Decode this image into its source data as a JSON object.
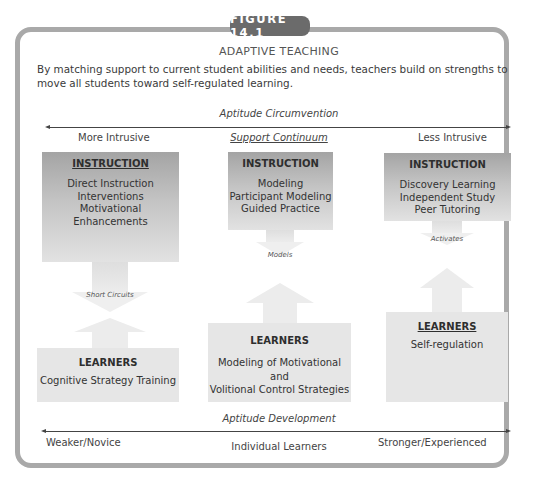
{
  "figure": {
    "badge": "FIGURE 14.1",
    "title": "ADAPTIVE TEACHING",
    "description": "By matching support to current student abilities and needs, teachers build on strengths to move all students toward self-regulated learning."
  },
  "top_axis": {
    "label": "Aptitude Circumvention",
    "left": "More Intrusive",
    "center": "Support Continuum",
    "right": "Less Intrusive"
  },
  "columns": [
    {
      "instruction": {
        "heading": "INSTRUCTION",
        "items": [
          "Direct Instruction",
          "Interventions",
          "Motivational Enhancements"
        ]
      },
      "connector": "Short Circuits",
      "learners": {
        "heading": "LEARNERS",
        "items": [
          "Cognitive Strategy Training"
        ]
      }
    },
    {
      "instruction": {
        "heading": "INSTRUCTION",
        "items": [
          "Modeling",
          "Participant Modeling",
          "Guided Practice"
        ]
      },
      "connector": "Models",
      "learners": {
        "heading": "LEARNERS",
        "items": [
          "Modeling of Motivational and",
          "Volitional Control Strategies"
        ]
      }
    },
    {
      "instruction": {
        "heading": "INSTRUCTION",
        "items": [
          "Discovery Learning",
          "Independent Study",
          "Peer Tutoring"
        ]
      },
      "connector": "Activates",
      "learners": {
        "heading": "LEARNERS",
        "items": [
          "Self-regulation"
        ]
      }
    }
  ],
  "bottom_axis": {
    "label": "Aptitude Development",
    "left": "Weaker/Novice",
    "center": "Individual Learners",
    "right": "Stronger/Experienced"
  },
  "colors": {
    "frame": "#a9a9a9",
    "badge": "#6b6b6b",
    "instruction_top": "#a4a4a4",
    "learners_box": "#e6e6e6"
  }
}
